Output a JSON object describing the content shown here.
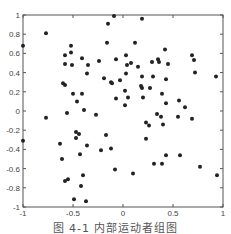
{
  "chart_data": {
    "type": "scatter",
    "title": "",
    "xlabel": "",
    "ylabel": "",
    "xlim": [
      -1,
      1
    ],
    "ylim": [
      -1,
      1
    ],
    "xticks": [
      -1,
      -0.5,
      0,
      0.5,
      1
    ],
    "xtick_labels": [
      "-1",
      "-0.5",
      "0",
      "0.5",
      "1"
    ],
    "yticks": [
      1,
      0.8,
      0.6,
      0.4,
      0.2,
      0,
      -0.2,
      -0.4,
      -0.6,
      -0.8,
      -1
    ],
    "ytick_labels": [
      "1",
      "0.8",
      "0.6",
      "0.4",
      "0.2",
      "0",
      "-0.2",
      "-0.4",
      "-0.6",
      "-0.8",
      "-1"
    ],
    "grid": false,
    "legend": null,
    "marker_color": "#222222",
    "series": [
      {
        "name": "points",
        "points": [
          [
            -1.0,
            0.68
          ],
          [
            -0.77,
            0.81
          ],
          [
            -0.09,
            0.99
          ],
          [
            -0.15,
            0.91
          ],
          [
            -0.16,
            0.71
          ],
          [
            -0.52,
            0.68
          ],
          [
            -0.52,
            0.61
          ],
          [
            -0.58,
            0.58
          ],
          [
            -0.58,
            0.49
          ],
          [
            -0.51,
            0.48
          ],
          [
            -0.41,
            0.55
          ],
          [
            -0.35,
            0.48
          ],
          [
            -0.24,
            0.52
          ],
          [
            -0.07,
            0.54
          ],
          [
            -0.36,
            0.39
          ],
          [
            -0.19,
            0.34
          ],
          [
            -0.12,
            0.3
          ],
          [
            -0.11,
            0.29
          ],
          [
            -0.03,
            0.32
          ],
          [
            -0.6,
            0.29
          ],
          [
            -0.58,
            0.27
          ],
          [
            -0.5,
            0.18
          ],
          [
            -0.41,
            0.18
          ],
          [
            -0.46,
            0.1
          ],
          [
            -0.39,
            0.01
          ],
          [
            -0.07,
            0.13
          ],
          [
            0.19,
            0.96
          ],
          [
            0.12,
            0.71
          ],
          [
            0.42,
            0.64
          ],
          [
            0.03,
            0.58
          ],
          [
            0.04,
            0.48
          ],
          [
            0.08,
            0.5
          ],
          [
            0.15,
            0.46
          ],
          [
            0.29,
            0.51
          ],
          [
            0.35,
            0.54
          ],
          [
            0.36,
            0.51
          ],
          [
            0.45,
            0.49
          ],
          [
            0.69,
            0.58
          ],
          [
            0.71,
            0.53
          ],
          [
            0.72,
            0.4
          ],
          [
            0.93,
            0.36
          ],
          [
            0.03,
            0.39
          ],
          [
            0.19,
            0.36
          ],
          [
            0.3,
            0.36
          ],
          [
            0.43,
            0.33
          ],
          [
            0.18,
            0.26
          ],
          [
            0.19,
            0.24
          ],
          [
            0.27,
            0.24
          ],
          [
            0.02,
            0.21
          ],
          [
            0.39,
            0.18
          ],
          [
            0.05,
            0.14
          ],
          [
            0.2,
            0.14
          ],
          [
            0.56,
            0.11
          ],
          [
            0.43,
            0.08
          ],
          [
            0.62,
            0.04
          ],
          [
            0.02,
            0.06
          ],
          [
            -0.77,
            -0.07
          ],
          [
            -0.56,
            -0.02
          ],
          [
            -0.27,
            -0.04
          ],
          [
            -1.0,
            -0.31
          ],
          [
            -0.47,
            -0.22
          ],
          [
            -0.44,
            -0.24
          ],
          [
            -0.47,
            -0.28
          ],
          [
            -0.17,
            -0.25
          ],
          [
            -0.63,
            -0.34
          ],
          [
            -0.36,
            -0.36
          ],
          [
            -0.12,
            -0.39
          ],
          [
            -0.22,
            -0.41
          ],
          [
            -0.43,
            -0.45
          ],
          [
            -0.61,
            -0.5
          ],
          [
            -0.08,
            -0.61
          ],
          [
            -0.4,
            -0.67
          ],
          [
            -0.55,
            -0.71
          ],
          [
            -0.58,
            -0.73
          ],
          [
            -0.42,
            -0.78
          ],
          [
            -0.49,
            -0.92
          ],
          [
            -0.37,
            -0.94
          ],
          [
            0.34,
            -0.03
          ],
          [
            0.38,
            -0.06
          ],
          [
            0.55,
            -0.06
          ],
          [
            0.69,
            -0.08
          ],
          [
            0.23,
            -0.12
          ],
          [
            0.26,
            -0.15
          ],
          [
            0.4,
            -0.14
          ],
          [
            0.23,
            -0.29
          ],
          [
            0.43,
            -0.46
          ],
          [
            0.57,
            -0.46
          ],
          [
            0.31,
            -0.55
          ],
          [
            0.39,
            -0.55
          ],
          [
            0.77,
            -0.58
          ],
          [
            0.1,
            -0.65
          ],
          [
            0.94,
            -0.67
          ]
        ]
      }
    ]
  },
  "caption": "图 4-1  内部运动者组图"
}
